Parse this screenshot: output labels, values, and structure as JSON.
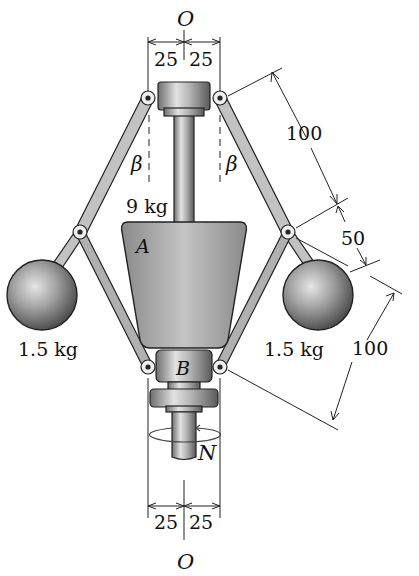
{
  "diagram": {
    "type": "mechanism",
    "axis_label_top": "O",
    "axis_label_bottom": "O",
    "top_dims": [
      "25",
      "25"
    ],
    "bottom_dims": [
      "25",
      "25"
    ],
    "link_dims": [
      "100",
      "50",
      "100"
    ],
    "angle_label_left": "β",
    "angle_label_right": "β",
    "center_mass_label": "9 kg",
    "collar_a_label": "A",
    "collar_b_label": "B",
    "left_ball_mass": "1.5 kg",
    "right_ball_mass": "1.5 kg",
    "rotation_label": "N",
    "colors": {
      "link": "#b8b8b8",
      "outline": "#222222",
      "mass_fill": "#9a9a9a",
      "collar_fill": "#a8a8a8"
    }
  }
}
